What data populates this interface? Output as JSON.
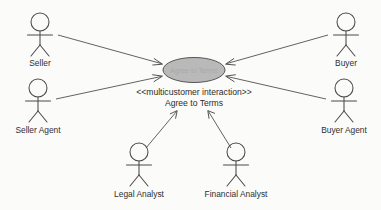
{
  "diagram": {
    "type": "uml-use-case-diagram",
    "background_color": "#fbfbf9",
    "line_color": "#4a4a4a",
    "usecase_fill_color": "#b9b9b9",
    "usecase_stroke_color": "#555555",
    "text_color": "#2f2f2f"
  },
  "usecase": {
    "stereotype": "<<multicustomer interaction>>",
    "name": "Agree to Terms",
    "inner_text": "Agree to Terms",
    "cx": 194,
    "cy": 70,
    "rx": 31,
    "ry": 13
  },
  "actors": [
    {
      "id": "seller",
      "label": "Seller",
      "x": 40,
      "y": 22,
      "label_x": 40,
      "label_y": 64,
      "position": "top-left"
    },
    {
      "id": "seller-agent",
      "label": "Seller Agent",
      "x": 38,
      "y": 88,
      "label_x": 38,
      "label_y": 131,
      "position": "bottom-left"
    },
    {
      "id": "buyer",
      "label": "Buyer",
      "x": 346,
      "y": 22,
      "label_x": 346,
      "label_y": 64,
      "position": "top-right"
    },
    {
      "id": "buyer-agent",
      "label": "Buyer Agent",
      "x": 344,
      "y": 88,
      "label_x": 344,
      "label_y": 131,
      "position": "bottom-right"
    },
    {
      "id": "legal-analyst",
      "label": "Legal Analyst",
      "x": 139,
      "y": 152,
      "label_x": 139,
      "label_y": 194,
      "position": "bottom-center-left"
    },
    {
      "id": "financial-analyst",
      "label": "Financial Analyst",
      "x": 236,
      "y": 152,
      "label_x": 236,
      "label_y": 194,
      "position": "bottom-center-right"
    }
  ],
  "associations": [
    {
      "from": "seller",
      "to": "usecase",
      "x1": 58,
      "y1": 35,
      "x2": 162,
      "y2": 64
    },
    {
      "from": "seller-agent",
      "to": "usecase",
      "x1": 56,
      "y1": 99,
      "x2": 162,
      "y2": 76
    },
    {
      "from": "buyer",
      "to": "usecase",
      "x1": 328,
      "y1": 35,
      "x2": 226,
      "y2": 64
    },
    {
      "from": "buyer-agent",
      "to": "usecase",
      "x1": 326,
      "y1": 99,
      "x2": 226,
      "y2": 76
    },
    {
      "from": "legal-analyst",
      "to": "usecase",
      "x1": 146,
      "y1": 148,
      "x2": 176,
      "y2": 112
    },
    {
      "from": "financial-analyst",
      "to": "usecase",
      "x1": 231,
      "y1": 148,
      "x2": 209,
      "y2": 112
    }
  ]
}
